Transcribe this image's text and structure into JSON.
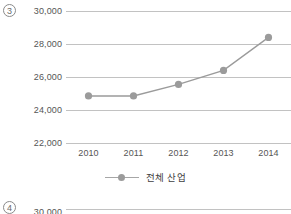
{
  "figures": [
    {
      "index_label": "3",
      "chart_data": {
        "type": "line",
        "title": "",
        "subtitle": "",
        "xlabel": "",
        "ylabel": "",
        "categories": [
          "2010",
          "2011",
          "2012",
          "2013",
          "2014"
        ],
        "series": [
          {
            "name": "전체 산업",
            "values": [
              24850,
              24850,
              25550,
              26400,
              28400
            ]
          }
        ],
        "ylim": [
          22000,
          30000
        ],
        "yticks": [
          30000,
          28000,
          26000,
          24000,
          22000
        ],
        "ytick_labels": [
          "30,000",
          "28,000",
          "26,000",
          "24,000",
          "22,000"
        ],
        "xtick_labels": [
          "2010",
          "2011",
          "2012",
          "2013",
          "2014"
        ],
        "grid": true,
        "legend_position": "bottom",
        "legend_entries": [
          "전체 산업"
        ],
        "colors": {
          "series": "#9b9b9b",
          "grid": "#c2c2c2",
          "text": "#555555"
        }
      }
    },
    {
      "index_label": "4",
      "chart_data": {
        "type": "line",
        "title": "",
        "ytick_labels": [
          "30,000"
        ],
        "grid": true,
        "note": "cropped at bottom edge"
      }
    }
  ]
}
